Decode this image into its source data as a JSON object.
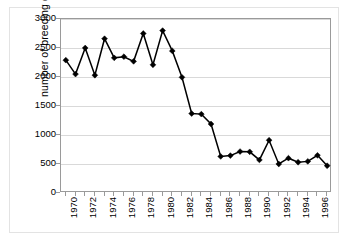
{
  "chart_data": {
    "type": "line",
    "title": "",
    "xlabel": "",
    "ylabel": "number of breeding ducks",
    "xlim": [
      1969.5,
      1997.5
    ],
    "ylim": [
      0,
      3000
    ],
    "grid": true,
    "legend": false,
    "y_ticks": [
      0,
      500,
      1000,
      1500,
      2000,
      2500,
      3000
    ],
    "y_tick_labels": [
      "0",
      "500",
      "1000",
      "1500",
      "2000",
      "2500",
      "3000"
    ],
    "x_ticks": [
      1970,
      1971,
      1972,
      1973,
      1974,
      1975,
      1976,
      1977,
      1978,
      1979,
      1980,
      1981,
      1982,
      1983,
      1984,
      1985,
      1986,
      1987,
      1988,
      1989,
      1990,
      1991,
      1992,
      1993,
      1994,
      1995,
      1996,
      1997
    ],
    "x_tick_labels": [
      "1970",
      "",
      "1972",
      "",
      "1974",
      "",
      "1976",
      "",
      "1978",
      "",
      "1980",
      "",
      "1982",
      "",
      "1984",
      "",
      "1986",
      "",
      "1988",
      "",
      "1990",
      "",
      "1992",
      "",
      "1994",
      "",
      "1996",
      ""
    ],
    "x": [
      1970,
      1971,
      1972,
      1973,
      1974,
      1975,
      1976,
      1977,
      1978,
      1979,
      1980,
      1981,
      1982,
      1983,
      1984,
      1985,
      1986,
      1987,
      1988,
      1989,
      1990,
      1991,
      1992,
      1993,
      1994,
      1995,
      1996,
      1997
    ],
    "values": [
      2290,
      2050,
      2500,
      2030,
      2660,
      2330,
      2350,
      2270,
      2750,
      2210,
      2800,
      2450,
      1995,
      1370,
      1360,
      1190,
      630,
      645,
      715,
      710,
      570,
      910,
      500,
      600,
      530,
      545,
      650,
      470
    ],
    "series": [
      {
        "name": "number of breeding ducks",
        "marker": "diamond",
        "color": "#000000",
        "values": [
          2290,
          2050,
          2500,
          2030,
          2660,
          2330,
          2350,
          2270,
          2750,
          2210,
          2800,
          2450,
          1995,
          1370,
          1360,
          1190,
          630,
          645,
          715,
          710,
          570,
          910,
          500,
          600,
          530,
          545,
          650,
          470
        ]
      }
    ]
  },
  "axes": {
    "y_title": "number of breeding ducks"
  }
}
